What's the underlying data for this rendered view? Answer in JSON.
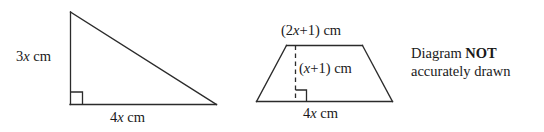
{
  "figure": {
    "background_color": "#ffffff",
    "stroke_color": "#2b2b2b",
    "text_color": "#1a1a1a",
    "note": {
      "line1_prefix": "Diagram ",
      "line1_emphasis": "NOT",
      "line2": "accurately drawn"
    },
    "triangle": {
      "name": "right-angled-triangle",
      "height_label_coeff": "3",
      "height_label_var": "x",
      "height_label_unit": " cm",
      "base_label_coeff": "4",
      "base_label_var": "x",
      "base_label_unit": " cm",
      "right_angle_marker": true,
      "vertices": [
        [
          70,
          12
        ],
        [
          70,
          104
        ],
        [
          216,
          104
        ]
      ]
    },
    "trapezoid": {
      "name": "trapezium",
      "top_label_open": "(2",
      "top_label_var": "x",
      "top_label_close": "+1) cm",
      "height_label_open": "(",
      "height_label_var": "x",
      "height_label_close": "+1) cm",
      "base_label_coeff": "4",
      "base_label_var": "x",
      "base_label_unit": " cm",
      "right_angle_marker": true,
      "dashed_height": true,
      "vertices": [
        [
          287,
          45
        ],
        [
          362,
          45
        ],
        [
          392,
          101
        ],
        [
          257,
          101
        ]
      ]
    }
  }
}
